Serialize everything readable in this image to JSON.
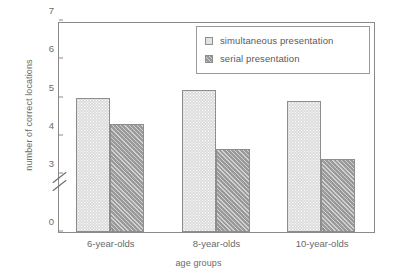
{
  "chart_data": {
    "type": "bar",
    "title": "",
    "xlabel": "age groups",
    "ylabel": "number of correct locations",
    "categories": [
      "6-year-olds",
      "8-year-olds",
      "10-year-olds"
    ],
    "series": [
      {
        "name": "simultaneous presentation",
        "values": [
          5.0,
          5.2,
          4.9
        ],
        "color": "#dcdcdc",
        "pattern": "stipple"
      },
      {
        "name": "serial presentation",
        "values": [
          4.3,
          3.65,
          3.4
        ],
        "color": "#9a9a9a",
        "pattern": "diagonal-hatch"
      }
    ],
    "ylim": [
      0,
      7
    ],
    "yticks": [
      0,
      3,
      4,
      5,
      6,
      7
    ],
    "ytick_labels": [
      "0",
      "3",
      "4",
      "5",
      "6",
      "7"
    ],
    "axis_break": {
      "present": true,
      "between": [
        0,
        3
      ]
    },
    "grid": false,
    "legend_position": "top-right",
    "frame": true
  },
  "legend": {
    "entries": [
      {
        "label": "simultaneous presentation",
        "swatch": "light-stipple-swatch"
      },
      {
        "label": "serial presentation",
        "swatch": "dark-hatch-swatch"
      }
    ]
  },
  "axes": {
    "y_title": "number of correct locations",
    "x_title": "age groups"
  }
}
